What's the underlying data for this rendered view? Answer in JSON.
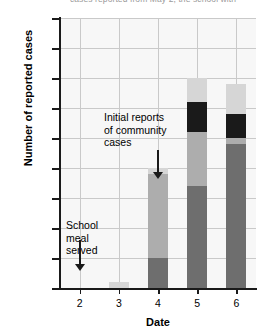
{
  "chart_data": {
    "type": "bar",
    "subtype": "stacked-bar",
    "title": "",
    "clipped_top_text": "cases reported from May 2, the school with",
    "xlabel": "Date",
    "ylabel": "Number of reported cases",
    "categories": [
      "2",
      "3",
      "4",
      "5",
      "6"
    ],
    "ylim": [
      0,
      45
    ],
    "ytick_step": 5,
    "yticks": [
      "45",
      "40",
      "35",
      "30",
      "25",
      "20",
      "15",
      "10",
      "5",
      "0"
    ],
    "grid": true,
    "legend": "none",
    "series": [
      {
        "name": "segment-1-dark-gray",
        "color": "#6e6e6e",
        "values": [
          0,
          0,
          5,
          17,
          24
        ]
      },
      {
        "name": "segment-2-medium-gray",
        "color": "#adadad",
        "values": [
          0,
          0,
          14,
          9,
          1
        ]
      },
      {
        "name": "segment-3-black",
        "color": "#1a1a1a",
        "values": [
          0,
          0,
          0,
          5,
          4
        ]
      },
      {
        "name": "segment-4-light-gray",
        "color": "#d6d6d6",
        "values": [
          0,
          1,
          1,
          4,
          5
        ]
      }
    ],
    "totals": [
      0,
      1,
      20,
      35,
      34
    ],
    "annotations": [
      {
        "name": "school-meal-served",
        "text": "School\nmeal\nserved",
        "target_category": "2",
        "arrow": "down"
      },
      {
        "name": "initial-reports-community-cases",
        "text": "Initial reports\nof community\ncases",
        "target_category": "4",
        "arrow": "down"
      }
    ],
    "colors": {
      "plot_background": "#f7f7f7",
      "gridline": "#c9c9c9",
      "axis": "#1a1a1a"
    }
  }
}
